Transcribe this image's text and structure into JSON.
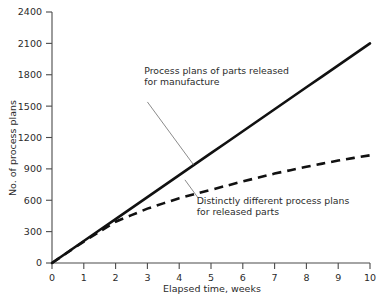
{
  "chart_data": {
    "type": "line",
    "title": "",
    "subtitle": "",
    "xlabel": "Elapsed time, weeks",
    "ylabel": "No. of process plans",
    "xlim": [
      0,
      10
    ],
    "ylim": [
      0,
      2400
    ],
    "grid": false,
    "legend_position": "none",
    "x_ticks": [
      "0",
      "1",
      "2",
      "3",
      "4",
      "5",
      "6",
      "7",
      "8",
      "9",
      "10"
    ],
    "y_ticks": [
      "0",
      "300",
      "600",
      "900",
      "1200",
      "1500",
      "1800",
      "2100",
      "2400"
    ],
    "x": [
      0,
      1,
      2,
      3,
      4,
      5,
      6,
      7,
      8,
      9,
      10
    ],
    "series": [
      {
        "name": "Process plans of parts released for manufacture",
        "style": "solid",
        "color": "#111111",
        "values": [
          0,
          210,
          420,
          630,
          840,
          1050,
          1260,
          1470,
          1680,
          1890,
          2100
        ]
      },
      {
        "name": "Distinctly different process plans for released parts",
        "style": "dashed",
        "color": "#111111",
        "values": [
          0,
          205,
          395,
          520,
          620,
          700,
          780,
          855,
          920,
          980,
          1030
        ]
      }
    ],
    "annotations": [
      {
        "id": "annotation-solid",
        "lines": [
          "Process plans of parts released",
          "for manufacture"
        ],
        "text_x": 2.9,
        "text_y": 1810,
        "leader_from": [
          3.0,
          1540
        ],
        "leader_to": [
          4.45,
          940
        ]
      },
      {
        "id": "annotation-dashed",
        "lines": [
          "Distinctly different process plans",
          "for released parts"
        ],
        "text_x": 4.55,
        "text_y": 560,
        "leader_from": [
          4.6,
          620
        ],
        "leader_to": [
          4.18,
          795
        ]
      }
    ]
  }
}
